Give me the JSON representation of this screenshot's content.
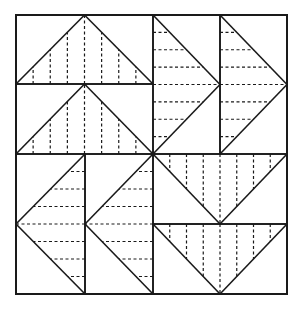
{
  "diagram": {
    "type": "quilt-block-pattern",
    "canvas": {
      "width": 304,
      "height": 321
    },
    "frame": {
      "x": 16,
      "y": 15,
      "width": 271,
      "height": 279
    },
    "center": {
      "x": 153,
      "y": 154
    },
    "colors": {
      "line": "#1a1a1a",
      "dash": "#1a1a1a",
      "background": "#ffffff"
    },
    "stroke": {
      "line": 1.6,
      "dash": 1.2,
      "dasharray": "3,2.5"
    },
    "units": [
      {
        "quadrant": "top-left",
        "x": 16,
        "y": 15,
        "w": 137,
        "h": 69,
        "pointing": "up",
        "hatch": "vertical",
        "lines": 7
      },
      {
        "quadrant": "top-left",
        "x": 16,
        "y": 84,
        "w": 137,
        "h": 70,
        "pointing": "up",
        "hatch": "vertical",
        "lines": 7
      },
      {
        "quadrant": "top-right",
        "x": 153,
        "y": 15,
        "w": 67,
        "h": 139,
        "pointing": "right",
        "hatch": "horizontal",
        "lines": 7
      },
      {
        "quadrant": "top-right",
        "x": 220,
        "y": 15,
        "w": 67,
        "h": 139,
        "pointing": "right",
        "hatch": "horizontal",
        "lines": 7
      },
      {
        "quadrant": "bottom-left",
        "x": 16,
        "y": 154,
        "w": 69,
        "h": 140,
        "pointing": "left",
        "hatch": "horizontal",
        "lines": 7
      },
      {
        "quadrant": "bottom-left",
        "x": 85,
        "y": 154,
        "w": 68,
        "h": 140,
        "pointing": "left",
        "hatch": "horizontal",
        "lines": 7
      },
      {
        "quadrant": "bottom-right",
        "x": 153,
        "y": 154,
        "w": 134,
        "h": 70,
        "pointing": "down",
        "hatch": "vertical",
        "lines": 7
      },
      {
        "quadrant": "bottom-right",
        "x": 153,
        "y": 224,
        "w": 134,
        "h": 70,
        "pointing": "down",
        "hatch": "vertical",
        "lines": 7
      }
    ]
  }
}
